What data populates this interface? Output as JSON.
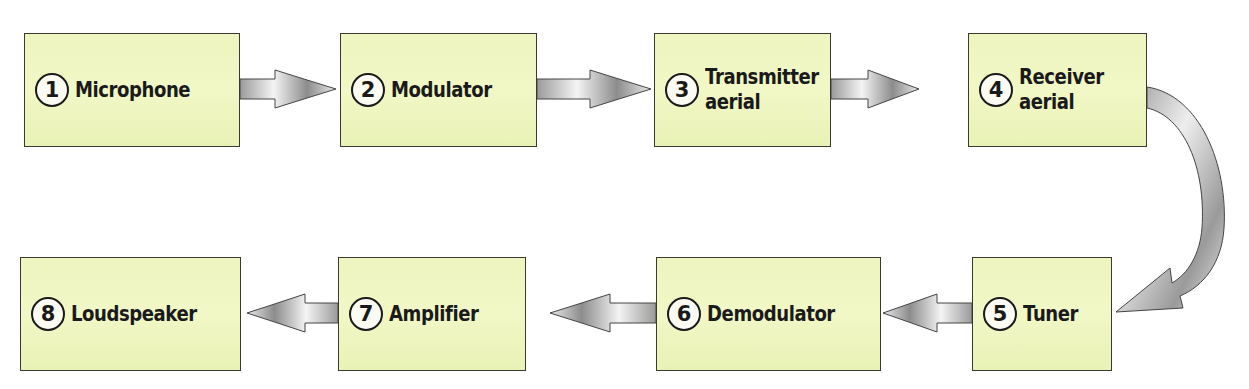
{
  "diagram": {
    "type": "block-flow",
    "box_fill": "#eef5c0",
    "box_border": "#3a3a30",
    "arrow_fill": "#b8b8b8",
    "blocks": [
      {
        "id": 1,
        "number": "1",
        "label": "Microphone",
        "row": 1
      },
      {
        "id": 2,
        "number": "2",
        "label": "Modulator",
        "row": 1
      },
      {
        "id": 3,
        "number": "3",
        "label_line1": "Transmitter",
        "label_line2": "aerial",
        "row": 1
      },
      {
        "id": 4,
        "number": "4",
        "label_line1": "Receiver",
        "label_line2": "aerial",
        "row": 1
      },
      {
        "id": 5,
        "number": "5",
        "label": "Tuner",
        "row": 2
      },
      {
        "id": 6,
        "number": "6",
        "label": "Demodulator",
        "row": 2
      },
      {
        "id": 7,
        "number": "7",
        "label": "Amplifier",
        "row": 2
      },
      {
        "id": 8,
        "number": "8",
        "label": "Loudspeaker",
        "row": 2
      }
    ],
    "connections": [
      {
        "from": 1,
        "to": 2,
        "direction": "right"
      },
      {
        "from": 2,
        "to": 3,
        "direction": "right"
      },
      {
        "from": 3,
        "to": 4,
        "direction": "right"
      },
      {
        "from": 4,
        "to": 5,
        "direction": "curved-down"
      },
      {
        "from": 5,
        "to": 6,
        "direction": "left"
      },
      {
        "from": 6,
        "to": 7,
        "direction": "left"
      },
      {
        "from": 7,
        "to": 8,
        "direction": "left"
      }
    ]
  }
}
